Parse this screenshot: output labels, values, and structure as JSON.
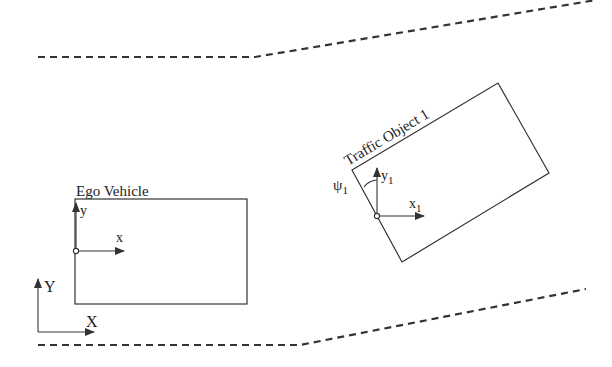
{
  "diagram": {
    "colors": {
      "line": "#333333",
      "background": "#ffffff"
    },
    "road": {
      "upper_boundary_points": [
        [
          38,
          57
        ],
        [
          255,
          57
        ],
        [
          596,
          0
        ]
      ],
      "lower_boundary_points": [
        [
          38,
          345
        ],
        [
          300,
          345
        ],
        [
          586,
          289
        ]
      ],
      "style": "dashed"
    },
    "ego_vehicle": {
      "label": "Ego Vehicle",
      "rect": {
        "x": 75,
        "y": 199,
        "width": 172,
        "height": 105
      },
      "origin": [
        76,
        251
      ],
      "axis_x_label": "x",
      "axis_y_label": "y"
    },
    "traffic_object": {
      "label": "Traffic Object 1",
      "corners": [
        [
          352,
          170
        ],
        [
          498,
          83
        ],
        [
          549,
          173
        ],
        [
          402,
          262
        ]
      ],
      "origin": [
        377,
        216
      ],
      "axis_x_label": "x",
      "axis_x_subscript": "1",
      "axis_y_label": "y",
      "axis_y_subscript": "1",
      "yaw_label": "ψ",
      "yaw_subscript": "1"
    },
    "global_frame": {
      "axis_x_label": "X",
      "axis_y_label": "Y",
      "origin": [
        38,
        332
      ]
    }
  }
}
